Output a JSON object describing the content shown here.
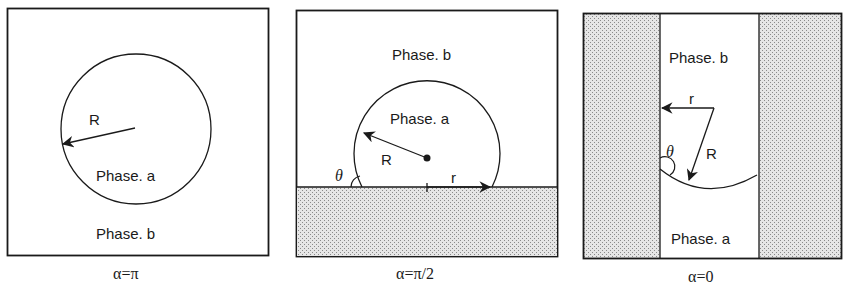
{
  "figure": {
    "panels": [
      {
        "id": "alpha-pi",
        "caption": "α=π",
        "labels": {
          "inner_phase": "Phase. a",
          "outer_phase": "Phase. b",
          "radius": "R"
        }
      },
      {
        "id": "alpha-pi-half",
        "caption": "α=π/2",
        "labels": {
          "outer_phase": "Phase. b",
          "inner_phase": "Phase. a",
          "radius": "R",
          "contact_angle": "θ",
          "contact_radius": "r"
        }
      },
      {
        "id": "alpha-zero",
        "caption": "α=0",
        "labels": {
          "upper_phase": "Phase. b",
          "lower_phase": "Phase. a",
          "radius": "R",
          "contact_angle": "θ",
          "pore_radius": "r"
        }
      }
    ],
    "colors": {
      "line": "#1a1a1a",
      "solid_fill": "#d9d9d9",
      "background": "#ffffff"
    }
  }
}
